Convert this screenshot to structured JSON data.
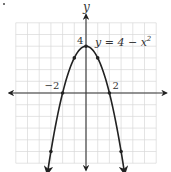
{
  "chart_data": {
    "type": "line",
    "title": "",
    "equation_label": "y = 4 − x²",
    "equation_parts": {
      "lhs": "y = 4 − x",
      "exp": "2"
    },
    "xlabel": "",
    "ylabel": "y",
    "xlim": [
      -6.5,
      6.8
    ],
    "ylim": [
      -6.6,
      6.7
    ],
    "grid": true,
    "grid_step": 1,
    "tick_labels": {
      "x": [
        {
          "value": -2,
          "text": "−2"
        },
        {
          "value": 2,
          "text": "2"
        }
      ],
      "y": [
        {
          "value": 4,
          "text": "4"
        }
      ]
    },
    "series": [
      {
        "name": "y = 4 − x²",
        "function": "4 - x^2",
        "x": [
          -3.3,
          -3,
          -2,
          -1,
          0,
          1,
          2,
          3,
          3.3
        ],
        "y": [
          -6.89,
          -5,
          0,
          3,
          4,
          3,
          0,
          -5,
          -6.89
        ],
        "marked_points": [
          [
            -3,
            -5
          ],
          [
            -2,
            0
          ],
          [
            -1,
            3
          ],
          [
            0,
            4
          ],
          [
            1,
            3
          ],
          [
            2,
            0
          ],
          [
            3,
            -5
          ]
        ]
      }
    ],
    "colors": {
      "curve": "#222222",
      "axis": "#333333",
      "grid": "#d9d9d9",
      "text": "#333333"
    }
  }
}
